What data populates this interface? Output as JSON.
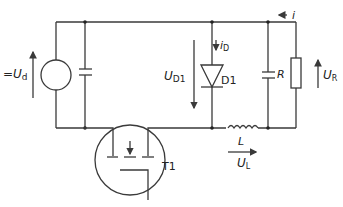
{
  "diagram": {
    "type": "circuit-schematic",
    "labels": {
      "source_voltage_prefix": "=",
      "source_voltage_main": "U",
      "source_voltage_sub": "d",
      "diode_voltage_main": "U",
      "diode_voltage_sub": "D1",
      "diode_current_main": "i",
      "diode_current_sub": "D",
      "diode_name": "D1",
      "load_current": "i",
      "resistor_name": "R",
      "resistor_voltage_main": "U",
      "resistor_voltage_sub": "R",
      "inductor_name": "L",
      "inductor_voltage_main": "U",
      "inductor_voltage_sub": "L",
      "transistor_name": "T1"
    },
    "components": [
      {
        "id": "source",
        "kind": "dc-voltage-source"
      },
      {
        "id": "input-capacitor",
        "kind": "capacitor"
      },
      {
        "id": "T1",
        "kind": "mosfet"
      },
      {
        "id": "D1",
        "kind": "diode"
      },
      {
        "id": "L",
        "kind": "inductor"
      },
      {
        "id": "output-capacitor",
        "kind": "capacitor"
      },
      {
        "id": "R",
        "kind": "resistor"
      }
    ],
    "colors": {
      "wire": "#3a3a3a",
      "text": "#222222",
      "background": "#ffffff"
    }
  }
}
